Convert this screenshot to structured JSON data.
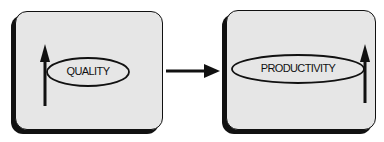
{
  "diagram": {
    "nodes": [
      {
        "id": "quality",
        "label": "QUALITY",
        "indicator": "up-arrow"
      },
      {
        "id": "productivity",
        "label": "PRODUCTIVITY",
        "indicator": "up-arrow"
      }
    ],
    "edges": [
      {
        "from": "quality",
        "to": "productivity",
        "type": "arrow"
      }
    ],
    "colors": {
      "fill": "#e6e6e6",
      "stroke": "#111111"
    }
  }
}
